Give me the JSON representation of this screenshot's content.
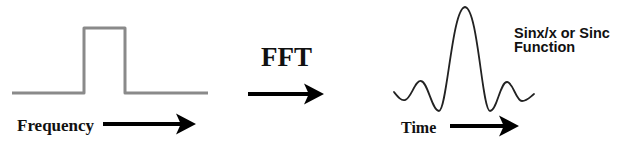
{
  "diagram": {
    "left_panel": {
      "name": "rectangular-pulse",
      "axis_label": "Frequency",
      "line_color": "#8a8a8a"
    },
    "transform": {
      "label": "FFT"
    },
    "right_panel": {
      "name": "sinc-waveform",
      "axis_label": "Time",
      "caption_line1": "Sinx/x or Sinc",
      "caption_line2": "Function",
      "line_color": "#222222"
    },
    "arrow_color": "#000000"
  }
}
